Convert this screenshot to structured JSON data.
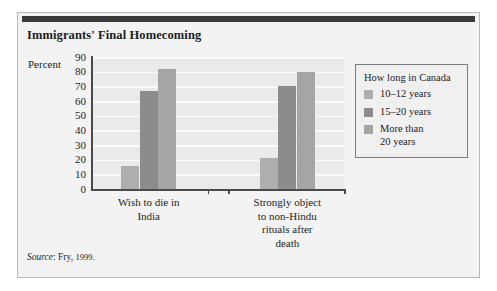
{
  "title": "Immigrants' Final Homecoming",
  "source": {
    "label": "Source",
    "separator": ":",
    "publication": "Fry,",
    "year": "1999."
  },
  "legend": {
    "title": "How long in Canada",
    "entries": [
      {
        "label": "10–12 years",
        "color": "#aeaeae"
      },
      {
        "label": "15–20 years",
        "color": "#8c8c8c"
      },
      {
        "label": "More than\n20 years",
        "line1": "More than",
        "line2": "20 years",
        "color": "#a5a5a5"
      }
    ]
  },
  "chart_data": {
    "type": "bar",
    "title": "Immigrants' Final Homecoming",
    "xlabel": "",
    "ylabel": "Percent",
    "ylim": [
      0,
      90
    ],
    "yticks": [
      0,
      10,
      20,
      30,
      40,
      50,
      60,
      70,
      80,
      90
    ],
    "grid": true,
    "legend_position": "right",
    "legend_title": "How long in Canada",
    "categories": [
      "Wish to die in India",
      "Strongly object to non-Hindu rituals after death"
    ],
    "category_lines": [
      [
        "Wish to die in",
        "India"
      ],
      [
        "Strongly object",
        "to non-Hindu",
        "rituals after",
        "death"
      ]
    ],
    "series": [
      {
        "name": "10–12 years",
        "color": "#aeaeae",
        "values": [
          16,
          21
        ]
      },
      {
        "name": "15–20 years",
        "color": "#8c8c8c",
        "values": [
          67,
          70
        ]
      },
      {
        "name": "More than 20 years",
        "color": "#a5a5a5",
        "values": [
          82,
          80
        ]
      }
    ]
  }
}
